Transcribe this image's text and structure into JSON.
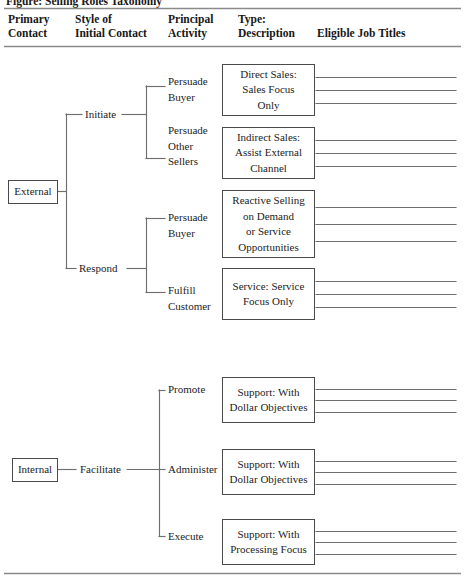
{
  "figure": {
    "cut_off_caption": "Figure: Selling Roles Taxonomy",
    "rules": {
      "top_rule_y": 8,
      "header_rule_y": 46,
      "bottom_rule_y": 573,
      "color": "#8a8a8a"
    },
    "line_color": "#6f6f6f",
    "box_border_color": "#4a4a4a"
  },
  "headers": [
    {
      "label": "Primary\nContact",
      "x": 8,
      "y": 12
    },
    {
      "label": "Style of\nInitial Contact",
      "x": 75,
      "y": 12
    },
    {
      "label": "Principal\nActivity",
      "x": 168,
      "y": 12
    },
    {
      "label": "Type:\nDescription",
      "x": 238,
      "y": 12
    },
    {
      "label": "Eligible Job Titles",
      "x": 317,
      "y": 26
    }
  ],
  "primary_contacts": [
    {
      "id": "external",
      "label": "External",
      "x": 8,
      "y": 180,
      "w": 50,
      "h": 24
    },
    {
      "id": "internal",
      "label": "Internal",
      "x": 12,
      "y": 458,
      "w": 46,
      "h": 24
    }
  ],
  "styles_of_initial_contact": [
    {
      "id": "initiate",
      "label": "Initiate",
      "x": 85,
      "y": 107
    },
    {
      "id": "respond",
      "label": "Respond",
      "x": 79,
      "y": 261
    },
    {
      "id": "facilitate",
      "label": "Facilitate",
      "x": 80,
      "y": 462
    }
  ],
  "principal_activities": [
    {
      "id": "persuade-buyer-1",
      "label": "Persuade\nBuyer",
      "x": 168,
      "y": 74
    },
    {
      "id": "persuade-other-sellers",
      "label": "Persuade\nOther\nSellers",
      "x": 168,
      "y": 123
    },
    {
      "id": "persuade-buyer-2",
      "label": "Persuade\nBuyer",
      "x": 168,
      "y": 210
    },
    {
      "id": "fulfill-customer",
      "label": "Fulfill\nCustomer",
      "x": 168,
      "y": 283
    },
    {
      "id": "promote",
      "label": "Promote",
      "x": 168,
      "y": 388
    },
    {
      "id": "administer",
      "label": "Administer",
      "x": 168,
      "y": 462
    },
    {
      "id": "execute",
      "label": "Execute",
      "x": 168,
      "y": 532
    }
  ],
  "type_descriptions": [
    {
      "id": "direct-sales",
      "label": "Direct  Sales:\nSales Focus\nOnly",
      "x": 222,
      "y": 64,
      "w": 93,
      "h": 52
    },
    {
      "id": "indirect-sales",
      "label": "Indirect Sales:\nAssist External\nChannel",
      "x": 222,
      "y": 127,
      "w": 93,
      "h": 52
    },
    {
      "id": "reactive-selling",
      "label": "Reactive Selling\non Demand\nor Service\nOpportunities",
      "x": 222,
      "y": 190,
      "w": 93,
      "h": 68
    },
    {
      "id": "service-focus",
      "label": "Service: Service\nFocus Only",
      "x": 222,
      "y": 268,
      "w": 93,
      "h": 52
    },
    {
      "id": "support-dollar-1",
      "label": "Support: With\nDollar Objectives",
      "x": 222,
      "y": 377,
      "w": 93,
      "h": 46
    },
    {
      "id": "support-dollar-2",
      "label": "Support: With\nDollar Objectives",
      "x": 222,
      "y": 449,
      "w": 93,
      "h": 46
    },
    {
      "id": "support-processing",
      "label": "Support: With\nProcessing Focus",
      "x": 222,
      "y": 519,
      "w": 93,
      "h": 46
    }
  ],
  "job_title_blanks": {
    "note": "Three blank ruled lines per Type: Description box for writing eligible job titles",
    "lines_per_box": 3,
    "x_start": 316,
    "x_end": 456
  },
  "connectors": {
    "external_trunk_x": 66,
    "external_trunk_top": 114,
    "external_trunk_bottom": 268,
    "external_stub_from": 58,
    "initiate_branch_x": 146,
    "initiate_branch_top": 86,
    "initiate_branch_bottom": 158,
    "respond_branch_x": 146,
    "respond_branch_top": 218,
    "respond_branch_bottom": 292,
    "internal_branch_x": 159,
    "internal_branch_top": 390,
    "internal_branch_bottom": 536
  }
}
